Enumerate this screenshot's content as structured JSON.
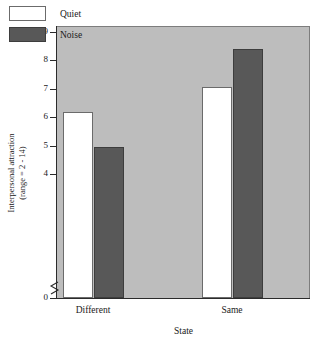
{
  "chart_data": {
    "type": "bar",
    "title": "",
    "xlabel": "State",
    "ylabel": "Interpersonal attraction (range = 2 - 14)",
    "ylabel_line1": "Interpersonal attraction",
    "ylabel_line2": "(range = 2 - 14)",
    "categories": [
      "Different",
      "Same"
    ],
    "series": [
      {
        "name": "Quiet",
        "color": "#ffffff",
        "values": [
          6.2,
          7.05
        ]
      },
      {
        "name": "Noise",
        "color": "#585858",
        "values": [
          4.95,
          8.4
        ]
      }
    ],
    "ylim": [
      4,
      9
    ],
    "yticks": [
      9,
      8,
      7,
      6,
      5,
      4,
      0
    ],
    "ytick_labels": [
      "9",
      "8",
      "7",
      "6",
      "5",
      "4",
      "0"
    ],
    "axis_break": true,
    "axis_break_between": [
      4,
      0
    ],
    "grid": false,
    "legend_position": "top-left",
    "plot_background": "#bdbdbd",
    "figure_background": "#ffffff"
  },
  "legend": {
    "items": [
      {
        "label": "Quiet"
      },
      {
        "label": "Noise"
      }
    ]
  }
}
